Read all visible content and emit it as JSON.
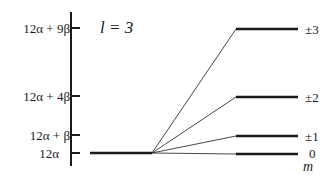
{
  "diagram": {
    "title": "l = 3",
    "axis_label": "m",
    "energy_levels": [
      {
        "label": "12α + 9β",
        "y": 28
      },
      {
        "label": "12α + 4β",
        "y": 96
      },
      {
        "label": "12α + β",
        "y": 135
      },
      {
        "label": "12α",
        "y": 154
      }
    ],
    "split_levels": [
      {
        "label": "±3",
        "y": 29
      },
      {
        "label": "±2",
        "y": 97
      },
      {
        "label": "±1",
        "y": 136
      },
      {
        "label": "0",
        "y": 154
      }
    ],
    "colors": {
      "line": "#1a1a1a",
      "background": "#ffffff"
    }
  }
}
